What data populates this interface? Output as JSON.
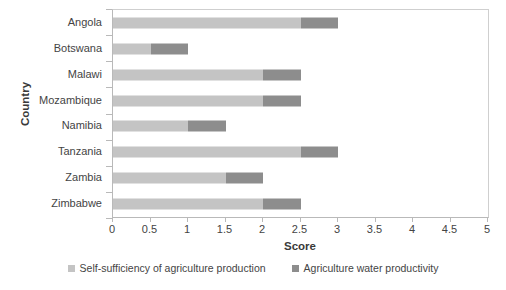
{
  "chart_data": {
    "type": "bar",
    "orientation": "horizontal",
    "stacked": true,
    "title": "",
    "xlabel": "Score",
    "ylabel": "Country",
    "xlim": [
      0,
      5
    ],
    "xticks": [
      "0",
      "0.5",
      "1",
      "1.5",
      "2",
      "2.5",
      "3",
      "3.5",
      "4",
      "4.5",
      "5"
    ],
    "xtick_values": [
      0,
      0.5,
      1,
      1.5,
      2,
      2.5,
      3,
      3.5,
      4,
      4.5,
      5
    ],
    "grid": false,
    "legend_position": "bottom",
    "categories": [
      "Angola",
      "Botswana",
      "Malawi",
      "Mozambique",
      "Namibia",
      "Tanzania",
      "Zambia",
      "Zimbabwe"
    ],
    "series": [
      {
        "name": "Self-sufficiency of agriculture production",
        "color": "#c4c4c4",
        "values": [
          2.5,
          0.5,
          2.0,
          2.0,
          1.0,
          2.5,
          1.5,
          2.0
        ]
      },
      {
        "name": "Agriculture water productivity",
        "color": "#8d8d8d",
        "values": [
          0.5,
          0.5,
          0.5,
          0.5,
          0.5,
          0.5,
          0.5,
          0.5
        ]
      }
    ],
    "totals": [
      3.0,
      1.0,
      2.5,
      2.5,
      1.5,
      3.0,
      2.0,
      2.5
    ]
  },
  "axes": {
    "x_title": "Score",
    "y_title": "Country"
  },
  "legend": {
    "items": [
      {
        "label": "Self-sufficiency of agriculture production",
        "color": "#c4c4c4"
      },
      {
        "label": "Agriculture water productivity",
        "color": "#8d8d8d"
      }
    ]
  }
}
